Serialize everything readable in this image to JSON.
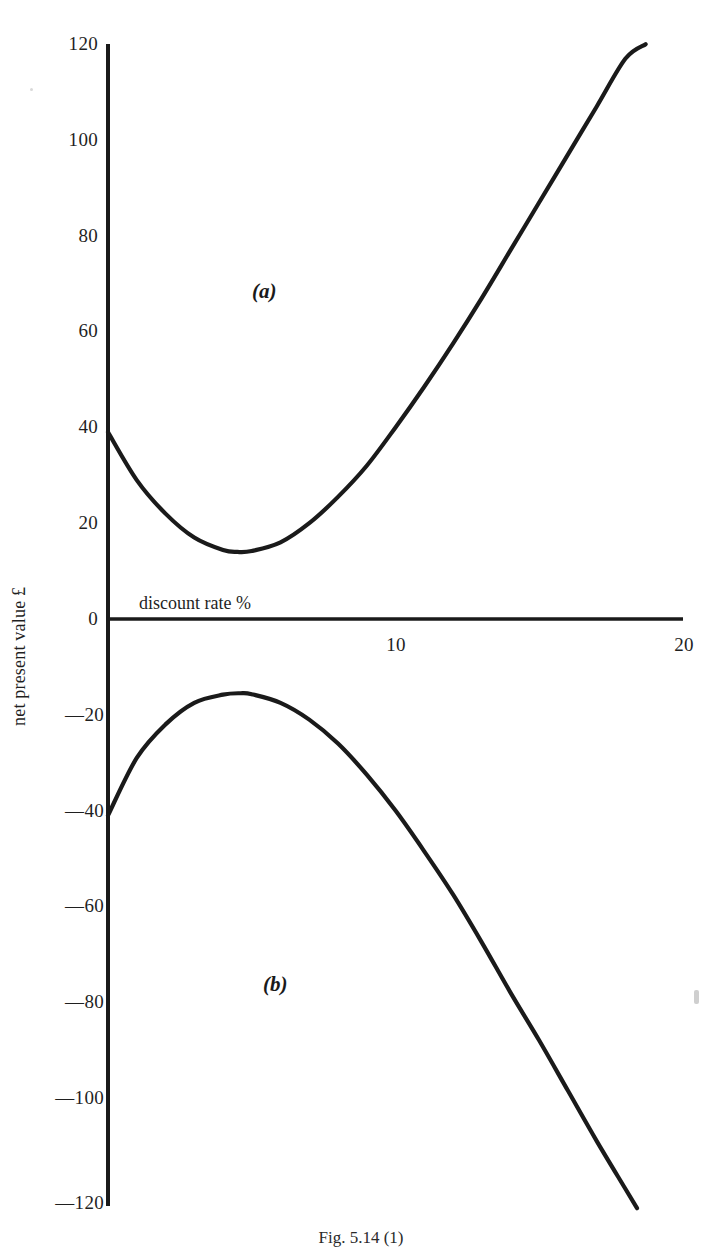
{
  "figure": {
    "caption": "Fig. 5.14 (1)",
    "background_color": "#ffffff",
    "ink_color": "#1a1a1a"
  },
  "axes": {
    "x_title": "discount rate %",
    "y_title": "net present value £",
    "x_ticks": [
      "10",
      "20"
    ],
    "y_ticks": [
      "120",
      "100",
      "80",
      "60",
      "40",
      "20",
      "0",
      "—20",
      "—40",
      "—60",
      "—80",
      "—100",
      "—120"
    ]
  },
  "labels": {
    "curve_a": "(a)",
    "curve_b": "(b)"
  },
  "chart_data": {
    "type": "line",
    "title": "Fig. 5.14 (1)",
    "xlabel": "discount rate %",
    "ylabel": "net present value £",
    "xlim": [
      0,
      20
    ],
    "ylim": [
      -120,
      120
    ],
    "xticks": [
      10,
      20
    ],
    "yticks": [
      -120,
      -100,
      -80,
      -60,
      -40,
      -20,
      0,
      20,
      40,
      60,
      80,
      100,
      120
    ],
    "grid": false,
    "legend": "none",
    "annotations": [
      {
        "text": "(a)",
        "x": 5.5,
        "y": 63
      },
      {
        "text": "(b)",
        "x": 5.9,
        "y": -77
      }
    ],
    "series": [
      {
        "name": "(a)",
        "label": "(a)",
        "color": "#1a1a1a",
        "x": [
          0,
          1,
          2,
          3,
          4,
          4.5,
          5,
          6,
          7,
          8,
          9,
          10,
          11,
          12,
          13,
          14,
          15,
          16,
          17,
          18,
          18.7
        ],
        "values": [
          39,
          29,
          22,
          17,
          14.4,
          14,
          14.2,
          16,
          20,
          25.5,
          32,
          40,
          48.5,
          57.5,
          67,
          77,
          87,
          97,
          107,
          117,
          120
        ]
      },
      {
        "name": "(b)",
        "label": "(b)",
        "color": "#1a1a1a",
        "x": [
          0,
          1,
          2,
          3,
          4,
          4.6,
          5,
          6,
          7,
          8,
          9,
          10,
          11,
          12,
          13,
          14,
          15,
          16,
          17,
          18,
          18.4
        ],
        "values": [
          -41,
          -29,
          -22,
          -17.5,
          -15.8,
          -15.5,
          -15.7,
          -17.5,
          -21,
          -26,
          -32.5,
          -40,
          -48.5,
          -57.5,
          -67.5,
          -78,
          -88,
          -98.5,
          -109,
          -119,
          -123
        ]
      }
    ]
  }
}
